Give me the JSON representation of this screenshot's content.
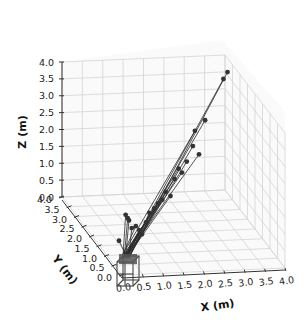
{
  "chart_data": {
    "type": "scatter3d",
    "title": "",
    "xlabel": "X (m)",
    "ylabel": "Y (m)",
    "zlabel": "Z (m)",
    "xlim": [
      0.0,
      4.0
    ],
    "ylim": [
      0.0,
      4.0
    ],
    "zlim": [
      0.0,
      4.0
    ],
    "x_ticks": [
      "0.0",
      "0.5",
      "1.0",
      "1.5",
      "2.0",
      "2.5",
      "3.0",
      "3.5",
      "4.0"
    ],
    "y_ticks": [
      "0.0",
      "0.5",
      "1.0",
      "1.5",
      "2.0",
      "2.5",
      "3.0",
      "3.5",
      "4.0"
    ],
    "z_ticks": [
      "0.0",
      "0.5",
      "1.0",
      "1.5",
      "2.0",
      "2.5",
      "3.0",
      "3.5",
      "4.0"
    ],
    "grid": true,
    "legend": null,
    "series": [
      {
        "name": "trajectories",
        "origin": [
          0.15,
          0.15,
          0.4
        ],
        "endpoints": [
          {
            "x": 0.2,
            "y": 0.3,
            "z": 1.6
          },
          {
            "x": 0.25,
            "y": 0.3,
            "z": 1.5
          },
          {
            "x": 0.3,
            "y": 0.35,
            "z": 1.4
          },
          {
            "x": 0.0,
            "y": 0.2,
            "z": 0.9
          },
          {
            "x": 0.35,
            "y": 0.3,
            "z": 1.2
          },
          {
            "x": 0.45,
            "y": 0.3,
            "z": 1.25
          },
          {
            "x": 0.55,
            "y": 0.35,
            "z": 1.1
          },
          {
            "x": 0.6,
            "y": 0.3,
            "z": 1.0
          },
          {
            "x": 0.7,
            "y": 0.3,
            "z": 1.35
          },
          {
            "x": 0.8,
            "y": 0.35,
            "z": 1.6
          },
          {
            "x": 0.9,
            "y": 0.3,
            "z": 1.75
          },
          {
            "x": 1.0,
            "y": 0.3,
            "z": 1.9
          },
          {
            "x": 1.1,
            "y": 0.3,
            "z": 2.0
          },
          {
            "x": 1.2,
            "y": 0.35,
            "z": 2.2
          },
          {
            "x": 1.3,
            "y": 0.3,
            "z": 2.1
          },
          {
            "x": 1.4,
            "y": 0.3,
            "z": 2.6
          },
          {
            "x": 1.5,
            "y": 0.3,
            "z": 2.9
          },
          {
            "x": 1.6,
            "y": 0.35,
            "z": 2.75
          },
          {
            "x": 1.7,
            "y": 0.3,
            "z": 3.1
          },
          {
            "x": 1.85,
            "y": 0.3,
            "z": 3.55
          },
          {
            "x": 1.9,
            "y": 0.3,
            "z": 4.0
          },
          {
            "x": 2.0,
            "y": 0.3,
            "z": 3.3
          },
          {
            "x": 2.15,
            "y": 0.3,
            "z": 4.3
          },
          {
            "x": 2.6,
            "y": 0.3,
            "z": 5.5
          },
          {
            "x": 2.7,
            "y": 0.3,
            "z": 5.7
          }
        ]
      }
    ]
  }
}
